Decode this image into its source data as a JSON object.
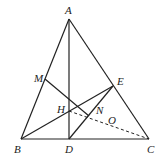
{
  "diagram": {
    "type": "geometry",
    "points": {
      "A": {
        "x": 69,
        "y": 19,
        "label": "A",
        "lx": 65,
        "ly": 14
      },
      "B": {
        "x": 21,
        "y": 139,
        "label": "B",
        "lx": 14,
        "ly": 153
      },
      "C": {
        "x": 149,
        "y": 139,
        "label": "C",
        "lx": 147,
        "ly": 153
      },
      "D": {
        "x": 69,
        "y": 139,
        "label": "D",
        "lx": 65,
        "ly": 153
      },
      "E": {
        "x": 113,
        "y": 86,
        "label": "E",
        "lx": 117,
        "ly": 85
      },
      "M": {
        "x": 45,
        "y": 79,
        "label": "M",
        "lx": 34,
        "ly": 82
      },
      "H": {
        "x": 69,
        "y": 111,
        "label": "H",
        "lx": 57,
        "ly": 113
      },
      "N": {
        "x": 89,
        "y": 116,
        "label": "N",
        "lx": 96,
        "ly": 114
      },
      "O": {
        "x": 110,
        "y": 126,
        "label": "O",
        "lx": 108,
        "ly": 124
      }
    },
    "segments_solid": [
      [
        "A",
        "B"
      ],
      [
        "A",
        "C"
      ],
      [
        "B",
        "C"
      ],
      [
        "A",
        "D"
      ],
      [
        "B",
        "E"
      ],
      [
        "M",
        "N"
      ],
      [
        "D",
        "E"
      ]
    ],
    "segments_dashed": [
      [
        "H",
        "C"
      ]
    ],
    "colors": {
      "stroke": "#222222",
      "background": "#ffffff"
    }
  }
}
